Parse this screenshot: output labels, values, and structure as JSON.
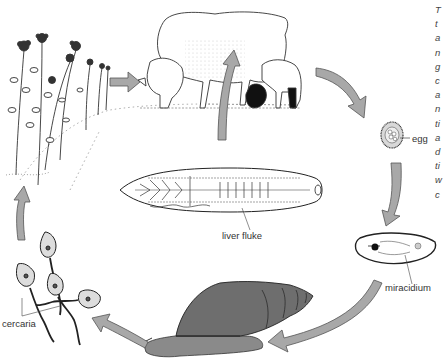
{
  "diagram": {
    "labels": {
      "egg": "egg",
      "miracidium": "miracidium",
      "cercaria": "cercaria",
      "liver_fluke": "liver fluke"
    },
    "stages": [
      {
        "name": "sheep",
        "description": "Sheep and lamb grazing (definitive host)"
      },
      {
        "name": "egg",
        "description": "Egg passed out"
      },
      {
        "name": "miracidium",
        "description": "Miracidium larva"
      },
      {
        "name": "snail",
        "description": "Snail (intermediate host)"
      },
      {
        "name": "cercaria",
        "description": "Cercaria larvae"
      },
      {
        "name": "vegetation",
        "description": "Grass/plants with cysts"
      },
      {
        "name": "liver-fluke",
        "description": "Adult liver fluke in sheep"
      }
    ],
    "side_text_fragments": [
      "T",
      "t",
      "a",
      "n",
      "g",
      "c",
      "a",
      "n",
      "ti",
      "a",
      "d",
      "ti",
      "w",
      "c"
    ],
    "colors": {
      "arrow_fill": "#a8a8a8",
      "arrow_stroke": "#555555",
      "snail_shell": "#6e6e6e",
      "snail_body": "#8a8a8a",
      "line": "#333333"
    }
  }
}
